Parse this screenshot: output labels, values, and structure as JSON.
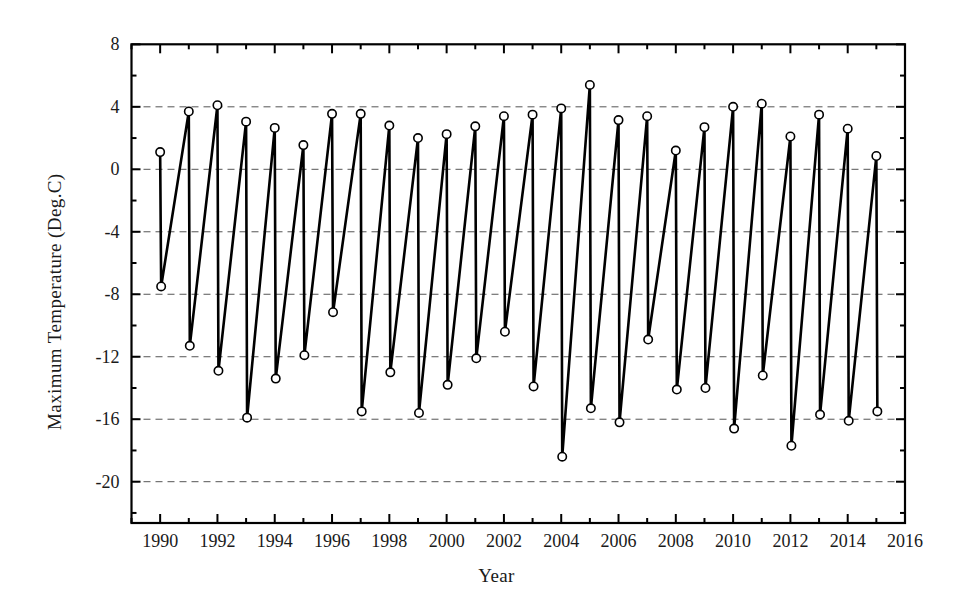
{
  "chart_data": {
    "type": "line",
    "title": "",
    "xlabel": "Year",
    "ylabel": "Maximum Temperature (Deg.C)",
    "xlim": [
      1989,
      2016
    ],
    "ylim": [
      -21.6,
      8
    ],
    "xticks": [
      1990,
      1992,
      1994,
      1996,
      1998,
      2000,
      2002,
      2004,
      2006,
      2008,
      2010,
      2012,
      2014,
      2016
    ],
    "xtick_labels": [
      "1990",
      "1992",
      "1994",
      "1996",
      "1998",
      "2000",
      "2002",
      "2004",
      "2006",
      "2008",
      "2010",
      "2012",
      "2014",
      "2016"
    ],
    "xtick_minor_step": 1,
    "yticks": [
      8,
      4,
      0,
      -4,
      -8,
      -12,
      -16,
      -20
    ],
    "ytick_labels": [
      "8",
      "4",
      "0",
      "-4",
      "-8",
      "-12",
      "-16",
      "-20"
    ],
    "ytick_minor_step": 2,
    "grid": "horizontal-dashed",
    "gridlines_at": [
      4,
      0,
      -4,
      -8,
      -12,
      -16,
      -20
    ],
    "legend": "none",
    "marker": "open-circle",
    "line_color": "#000000",
    "marker_face_color": "#ffffff",
    "marker_edge_color": "#000000",
    "x": [
      1990,
      1990.1,
      1991,
      1991.1,
      1992,
      1992.1,
      1993,
      1993.1,
      1994,
      1994.1,
      1995,
      1995.1,
      1996,
      1996.1,
      1997,
      1997.1,
      1998,
      1998.1,
      1999,
      1999.1,
      2000,
      2000.1,
      2001,
      2001.1,
      2002,
      2002.1,
      2003,
      2003.1,
      2004,
      2004.1,
      2005,
      2005.1,
      2006,
      2006.1,
      2007,
      2007.1,
      2008,
      2008.1,
      2009,
      2009.1,
      2010,
      2010.1,
      2011,
      2011.1,
      2012,
      2012.1,
      2013,
      2013.1,
      2014,
      2014.1,
      2015,
      2015.1
    ],
    "values": [
      1.1,
      -7.5,
      3.7,
      -11.3,
      4.1,
      -12.9,
      3.05,
      -15.9,
      2.65,
      -13.4,
      1.55,
      -11.9,
      3.55,
      -9.15,
      3.55,
      -15.5,
      2.8,
      -13.0,
      2.0,
      -15.6,
      2.25,
      -13.8,
      2.75,
      -12.1,
      3.4,
      -10.4,
      3.5,
      -13.9,
      3.9,
      -18.4,
      5.4,
      -15.3,
      3.15,
      -16.2,
      3.4,
      -10.9,
      1.2,
      -14.1,
      2.7,
      -14.0,
      4.0,
      -16.6,
      4.2,
      -13.2,
      2.1,
      -17.7,
      3.5,
      -15.7,
      2.6,
      -16.1,
      0.85,
      -15.5
    ],
    "series": [
      {
        "name": "Maximum Temperature",
        "yearly": [
          {
            "year": 1990,
            "max": 1.1,
            "min": -7.5
          },
          {
            "year": 1991,
            "max": 3.7,
            "min": -11.3
          },
          {
            "year": 1992,
            "max": 4.1,
            "min": -12.9
          },
          {
            "year": 1993,
            "max": 3.05,
            "min": -15.9
          },
          {
            "year": 1994,
            "max": 2.65,
            "min": -13.4
          },
          {
            "year": 1995,
            "max": 1.55,
            "min": -11.9
          },
          {
            "year": 1996,
            "max": 3.55,
            "min": -9.15
          },
          {
            "year": 1997,
            "max": 3.55,
            "min": -15.5
          },
          {
            "year": 1998,
            "max": 2.8,
            "min": -13.0
          },
          {
            "year": 1999,
            "max": 2.0,
            "min": -15.6
          },
          {
            "year": 2000,
            "max": 2.25,
            "min": -13.8
          },
          {
            "year": 2001,
            "max": 2.75,
            "min": -12.1
          },
          {
            "year": 2002,
            "max": 3.4,
            "min": -10.4
          },
          {
            "year": 2003,
            "max": 3.5,
            "min": -13.9
          },
          {
            "year": 2004,
            "max": 3.9,
            "min": -18.4
          },
          {
            "year": 2005,
            "max": 5.4,
            "min": -15.3
          },
          {
            "year": 2006,
            "max": 3.15,
            "min": -16.2
          },
          {
            "year": 2007,
            "max": 3.4,
            "min": -10.9
          },
          {
            "year": 2008,
            "max": 1.2,
            "min": -14.1
          },
          {
            "year": 2009,
            "max": 2.7,
            "min": -14.0
          },
          {
            "year": 2010,
            "max": 4.0,
            "min": -16.6
          },
          {
            "year": 2011,
            "max": 4.2,
            "min": -13.2
          },
          {
            "year": 2012,
            "max": 2.1,
            "min": -17.7
          },
          {
            "year": 2013,
            "max": 3.5,
            "min": -15.7
          },
          {
            "year": 2014,
            "max": 2.6,
            "min": -16.1
          },
          {
            "year": 2015,
            "max": 0.85,
            "min": -15.5
          }
        ]
      }
    ]
  }
}
